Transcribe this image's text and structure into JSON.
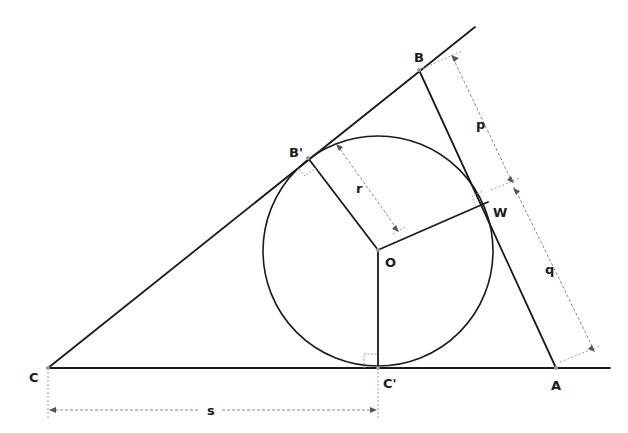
{
  "diagram": {
    "points": {
      "A": {
        "label": "A",
        "x": 556,
        "y": 368
      },
      "B": {
        "label": "B",
        "x": 419,
        "y": 70
      },
      "C": {
        "label": "C",
        "x": 48,
        "y": 368
      },
      "O": {
        "label": "O",
        "x": 378,
        "y": 250
      },
      "B_prime": {
        "label": "B'",
        "x": 308,
        "y": 158
      },
      "C_prime": {
        "label": "C'",
        "x": 378,
        "y": 368
      },
      "W": {
        "label": "W",
        "x": 488,
        "y": 202
      }
    },
    "circle": {
      "center": "O",
      "radius": 115
    },
    "dimensions": {
      "r": {
        "label": "r",
        "from": "tangent point on CB",
        "to": "O"
      },
      "p": {
        "label": "p",
        "from": "B",
        "to": "W"
      },
      "q": {
        "label": "q",
        "from": "W",
        "to": "A"
      },
      "s": {
        "label": "s",
        "from": "C",
        "to": "C'"
      }
    },
    "right_angle_marks": [
      "B'",
      "W",
      "C'"
    ],
    "colors": {
      "line": "#1a1a1a",
      "dimension": "#8a8a8a",
      "background": "#ffffff"
    }
  }
}
